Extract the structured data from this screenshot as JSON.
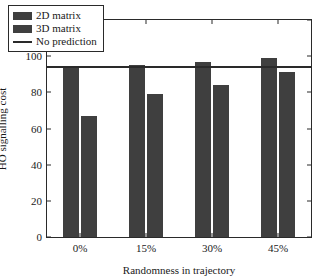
{
  "chart_data": {
    "type": "bar",
    "title": "",
    "xlabel": "Randomness in trajectory",
    "ylabel": "HO signalling cost",
    "categories": [
      "0%",
      "15%",
      "30%",
      "45%"
    ],
    "series": [
      {
        "name": "2D matrix",
        "values": [
          94,
          95,
          97,
          99
        ],
        "color": "#3f3f3f"
      },
      {
        "name": "3D matrix",
        "values": [
          67,
          79,
          84,
          91
        ],
        "color": "#3f3f3f"
      }
    ],
    "annotations": [
      {
        "name": "No prediction",
        "type": "hline",
        "value": 94,
        "color": "#2a2a2a"
      }
    ],
    "ylim": [
      0,
      120
    ],
    "yticks": [
      0,
      20,
      40,
      60,
      80,
      100,
      120
    ],
    "ytick_labels": [
      "0",
      "20",
      "40",
      "60",
      "80",
      "100",
      "120"
    ],
    "grid": false,
    "legend_position": "upper left",
    "legend_entries": [
      "2D matrix",
      "3D matrix",
      "No prediction"
    ]
  },
  "legend": {
    "items": [
      {
        "label": "2D matrix",
        "kind": "swatch"
      },
      {
        "label": "3D matrix",
        "kind": "swatch"
      },
      {
        "label": "No prediction",
        "kind": "line"
      }
    ]
  },
  "axes": {
    "y_label": "HO signalling cost",
    "x_label": "Randomness in trajectory",
    "y_ticks": [
      "0",
      "20",
      "40",
      "60",
      "80",
      "100",
      "120"
    ],
    "x_ticks": [
      "0%",
      "15%",
      "30%",
      "45%"
    ]
  }
}
